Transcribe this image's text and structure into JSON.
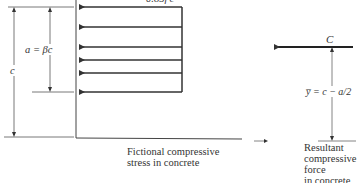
{
  "diagram": {
    "stress_block_label": "0.85f′c",
    "depth_a_label": "a = βc",
    "depth_c_label": "c",
    "force_label": "C",
    "lever_arm_label": "y̅ = c − a/2",
    "stress_caption": [
      "Fictional compressive",
      "stress in concrete"
    ],
    "force_caption": [
      "Resultant",
      "compressive",
      "force",
      "in concrete"
    ],
    "arrow_y_positions": [
      7,
      27,
      47,
      60,
      73,
      92
    ],
    "colors": {
      "line": "#333333",
      "text": "#333333",
      "background": "#ffffff"
    }
  }
}
